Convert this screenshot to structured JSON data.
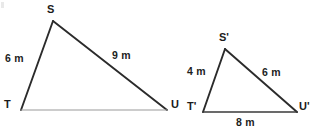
{
  "figure": {
    "units": "m",
    "background_color": "#ffffff",
    "stroke_dark": "#2b2b2b",
    "stroke_light": "#9a9a9a",
    "text_color": "#1b1b1b"
  },
  "triangle_left": {
    "name": "triangle-STU",
    "vertices": {
      "S": {
        "label": "S",
        "x": 53,
        "y": 21
      },
      "T": {
        "label": "T",
        "x": 21,
        "y": 110
      },
      "U": {
        "label": "U",
        "x": 167,
        "y": 110
      }
    },
    "sides": [
      {
        "name": "side-ST",
        "label": "6 m",
        "value": 6,
        "unit": "m",
        "from": "T",
        "to": "S"
      },
      {
        "name": "side-SU",
        "label": "9 m",
        "value": 9,
        "unit": "m",
        "from": "S",
        "to": "U"
      },
      {
        "name": "side-TU",
        "label": "",
        "value": null,
        "unit": "m",
        "from": "T",
        "to": "U"
      }
    ]
  },
  "triangle_right": {
    "name": "triangle-S-prime-T-prime-U-prime",
    "vertices": {
      "S_prime": {
        "label": "S'",
        "x": 225,
        "y": 49
      },
      "T_prime": {
        "label": "T'",
        "x": 203,
        "y": 112
      },
      "U_prime": {
        "label": "U'",
        "x": 297,
        "y": 112
      }
    },
    "sides": [
      {
        "name": "side-S-prime-T-prime",
        "label": "4 m",
        "value": 4,
        "unit": "m",
        "from": "T_prime",
        "to": "S_prime"
      },
      {
        "name": "side-S-prime-U-prime",
        "label": "6 m",
        "value": 6,
        "unit": "m",
        "from": "S_prime",
        "to": "U_prime"
      },
      {
        "name": "side-T-prime-U-prime",
        "label": "8 m",
        "value": 8,
        "unit": "m",
        "from": "T_prime",
        "to": "U_prime"
      }
    ]
  },
  "labels": {
    "left_S": "S",
    "left_T": "T",
    "left_U": "U",
    "left_ST": "6 m",
    "left_SU": "9 m",
    "right_S": "S'",
    "right_T": "T'",
    "right_U": "U'",
    "right_ST": "4 m",
    "right_SU": "6 m",
    "right_TU": "8 m"
  }
}
